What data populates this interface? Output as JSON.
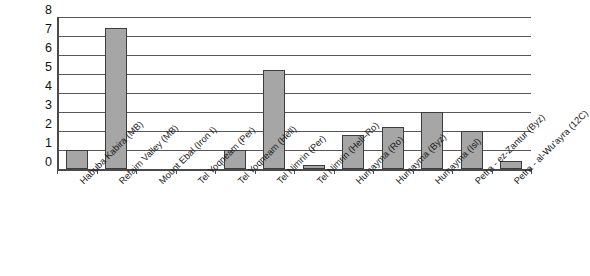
{
  "chart_data": {
    "type": "bar",
    "title": "",
    "xlabel": "",
    "ylabel": "",
    "ylim": [
      0,
      8
    ],
    "ytick_labels": [
      "8",
      "7",
      "6",
      "5",
      "4",
      "3",
      "2",
      "1",
      "0"
    ],
    "yticks": [
      8,
      7,
      6,
      5,
      4,
      3,
      2,
      1,
      0
    ],
    "grid": true,
    "legend": "none",
    "bar_color": "#a6a6a6",
    "bar_edge_color": "#3d3d3d",
    "axis_color": "#4a4a4c",
    "gridline_color": "#58585a",
    "categories": [
      "Habuba Kabira (MB)",
      "Refaim Valley (MB)",
      "Mount Ebal (Iron I)",
      "Tel Yoqneam (Per)",
      "Tel Yoqneam (Hell)",
      "Tel Nimrin (Per)",
      "Tel Nimrin (Hell–Ro)",
      "Humayma (Ro)",
      "Humayma (Byz)",
      "Humayma (Isl)",
      "Petra - ez-Zantur (Byz)",
      "Petra - al-Wu'ayra (12C)"
    ],
    "values": [
      1.0,
      7.4,
      0,
      0,
      1.0,
      5.2,
      0.2,
      1.8,
      2.2,
      3.0,
      2.0,
      0.4
    ]
  }
}
